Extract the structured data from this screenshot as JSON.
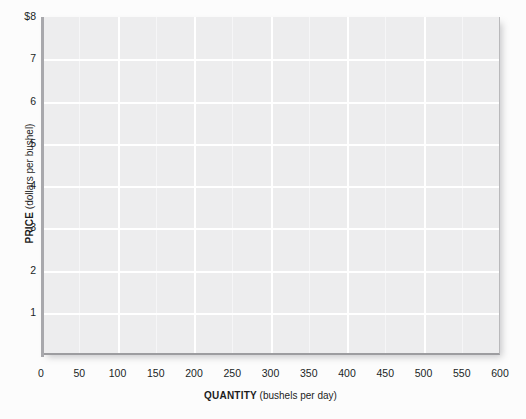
{
  "chart_data": {
    "type": "line",
    "title": "",
    "subtitle": "",
    "xlabel_bold": "QUANTITY",
    "xlabel_unit": "(bushels per day)",
    "ylabel_bold": "PRICE",
    "ylabel_unit": "(dollars per bushel)",
    "xlim": [
      0,
      600
    ],
    "ylim": [
      0,
      8
    ],
    "x_ticks": [
      0,
      50,
      100,
      150,
      200,
      250,
      300,
      350,
      400,
      450,
      500,
      550,
      600
    ],
    "x_tick_labels": [
      "0",
      "50",
      "100",
      "150",
      "200",
      "250",
      "300",
      "350",
      "400",
      "450",
      "500",
      "550",
      "600"
    ],
    "y_ticks": [
      1,
      2,
      3,
      4,
      5,
      6,
      7,
      8
    ],
    "y_tick_labels": [
      "1",
      "2",
      "3",
      "4",
      "5",
      "6",
      "7",
      "$8"
    ],
    "grid": true,
    "grid_color": "#ffffff",
    "grid_major_x_step": 100,
    "grid_minor_x_step": 50,
    "grid_major_y_step": 1,
    "legend": null,
    "series": [],
    "annotations": [],
    "plot_background_color": "#ededee",
    "page_background_color": "#fcfcfc",
    "axis_line_color": "#a8a8ac",
    "text_color": "#1c1c1c"
  }
}
